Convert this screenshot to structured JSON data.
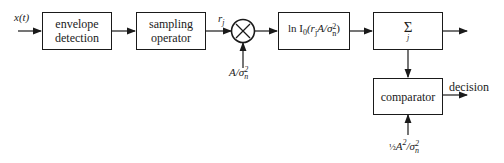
{
  "diagram": {
    "input_label": "x(t)",
    "blocks": [
      {
        "id": "envelope",
        "line1": "envelope",
        "line2": "detection"
      },
      {
        "id": "sampling",
        "line1": "sampling",
        "line2": "operator"
      },
      {
        "id": "multiplier",
        "symbol": "⨯"
      },
      {
        "id": "log_bessel",
        "text_prefix": "ln I",
        "text_sub": "0",
        "text_mid": "(r",
        "text_sub2": "j",
        "text_mid2": "A/σ",
        "text_sup": "2",
        "text_sub3": "n",
        "text_end": ")"
      },
      {
        "id": "sum",
        "symbol": "Σ",
        "index": "j"
      },
      {
        "id": "comparator",
        "line1": "comparator"
      }
    ],
    "sample_label": {
      "base": "r",
      "sub": "j"
    },
    "multiplier_input": {
      "base": "A/σ",
      "sup": "2",
      "sub": "n"
    },
    "threshold": {
      "frac": "½",
      "base": "A",
      "sup": "2",
      "mid": "/σ",
      "sup2": "2",
      "sub": "n"
    },
    "output_label": "decision"
  }
}
